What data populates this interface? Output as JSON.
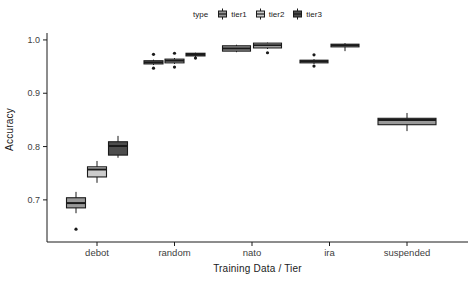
{
  "figure": {
    "background": "#ffffff",
    "axis_line_color": "#1a1a1a",
    "tick_text_color": "#404040",
    "title_text_color": "#1a1a1a"
  },
  "legend": {
    "title": "type",
    "entries": [
      {
        "label": "tier1",
        "fill": "#999999"
      },
      {
        "label": "tier2",
        "fill": "#cccccc"
      },
      {
        "label": "tier3",
        "fill": "#4d4d4d"
      }
    ]
  },
  "chart_data": {
    "type": "boxplot",
    "title": "",
    "xlabel": "Training Data / Tier",
    "ylabel": "Accuracy",
    "ylim": [
      0.621,
      1.013
    ],
    "grid": false,
    "legend_position": "top",
    "yticks": [
      {
        "label": "1.0",
        "value": 1.0
      },
      {
        "label": "0.9",
        "value": 0.9
      },
      {
        "label": "0.8",
        "value": 0.8
      },
      {
        "label": "0.7",
        "value": 0.7
      }
    ],
    "categories": [
      "debot",
      "random",
      "nato",
      "ira",
      "suspended"
    ],
    "series_key": "tier",
    "boxes": [
      {
        "category": "debot",
        "tier": "tier1",
        "whisker_low": 0.675,
        "q1": 0.685,
        "median": 0.694,
        "q3": 0.704,
        "whisker_high": 0.715,
        "outliers": [
          0.645
        ]
      },
      {
        "category": "debot",
        "tier": "tier2",
        "whisker_low": 0.732,
        "q1": 0.743,
        "median": 0.757,
        "q3": 0.762,
        "whisker_high": 0.773,
        "outliers": []
      },
      {
        "category": "debot",
        "tier": "tier3",
        "whisker_low": 0.779,
        "q1": 0.784,
        "median": 0.801,
        "q3": 0.809,
        "whisker_high": 0.82,
        "outliers": []
      },
      {
        "category": "random",
        "tier": "tier1",
        "whisker_low": 0.953,
        "q1": 0.955,
        "median": 0.958,
        "q3": 0.961,
        "whisker_high": 0.963,
        "outliers": [
          0.973,
          0.947
        ]
      },
      {
        "category": "random",
        "tier": "tier2",
        "whisker_low": 0.955,
        "q1": 0.957,
        "median": 0.961,
        "q3": 0.964,
        "whisker_high": 0.966,
        "outliers": [
          0.975,
          0.949
        ]
      },
      {
        "category": "random",
        "tier": "tier3",
        "whisker_low": 0.968,
        "q1": 0.97,
        "median": 0.973,
        "q3": 0.975,
        "whisker_high": 0.976,
        "outliers": [
          0.966
        ]
      },
      {
        "category": "nato",
        "tier": "tier1",
        "whisker_low": 0.977,
        "q1": 0.979,
        "median": 0.984,
        "q3": 0.989,
        "whisker_high": 0.991,
        "outliers": []
      },
      {
        "category": "nato",
        "tier": "tier2",
        "whisker_low": 0.983,
        "q1": 0.985,
        "median": 0.99,
        "q3": 0.994,
        "whisker_high": 0.995,
        "outliers": [
          0.976
        ]
      },
      {
        "category": "ira",
        "tier": "tier1",
        "whisker_low": 0.955,
        "q1": 0.957,
        "median": 0.96,
        "q3": 0.962,
        "whisker_high": 0.964,
        "outliers": [
          0.972,
          0.951
        ]
      },
      {
        "category": "ira",
        "tier": "tier2",
        "whisker_low": 0.979,
        "q1": 0.987,
        "median": 0.99,
        "q3": 0.992,
        "whisker_high": 0.994,
        "outliers": []
      },
      {
        "category": "suspended",
        "tier": "tier1",
        "whisker_low": 0.829,
        "q1": 0.841,
        "median": 0.85,
        "q3": 0.853,
        "whisker_high": 0.863,
        "outliers": []
      }
    ]
  }
}
